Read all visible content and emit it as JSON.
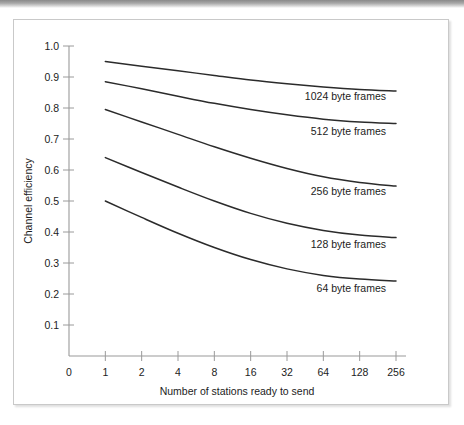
{
  "chart_data": {
    "type": "line",
    "title": "",
    "xlabel": "Number of stations ready to send",
    "ylabel": "Channel efficiency",
    "x_tick_labels": [
      "0",
      "1",
      "2",
      "4",
      "8",
      "16",
      "32",
      "64",
      "128",
      "256"
    ],
    "x_tick_values": [
      0,
      1,
      2,
      4,
      8,
      16,
      32,
      64,
      128,
      256
    ],
    "x_scale": "log2-categorical",
    "y_tick_labels": [
      "0.1",
      "0.2",
      "0.3",
      "0.4",
      "0.5",
      "0.6",
      "0.7",
      "0.8",
      "0.9",
      "1.0"
    ],
    "y_tick_values": [
      0.1,
      0.2,
      0.3,
      0.4,
      0.5,
      0.6,
      0.7,
      0.8,
      0.9,
      1.0
    ],
    "ylim": [
      0.0,
      1.0
    ],
    "grid": false,
    "legend_position": "inline-right-of-curves",
    "categories": [
      1,
      2,
      4,
      8,
      16,
      32,
      64,
      128,
      256
    ],
    "series": [
      {
        "name": "1024 byte frames",
        "label": "1024 byte frames",
        "color": "#2b2b2b",
        "values": [
          0.95,
          0.935,
          0.92,
          0.905,
          0.89,
          0.878,
          0.868,
          0.86,
          0.855
        ]
      },
      {
        "name": "512 byte frames",
        "label": "512 byte frames",
        "color": "#2b2b2b",
        "values": [
          0.885,
          0.862,
          0.838,
          0.815,
          0.795,
          0.778,
          0.764,
          0.755,
          0.75
        ]
      },
      {
        "name": "256 byte frames",
        "label": "256 byte frames",
        "color": "#2b2b2b",
        "values": [
          0.795,
          0.755,
          0.715,
          0.675,
          0.638,
          0.605,
          0.578,
          0.56,
          0.548
        ]
      },
      {
        "name": "128 byte frames",
        "label": "128 byte frames",
        "color": "#2b2b2b",
        "values": [
          0.64,
          0.592,
          0.545,
          0.5,
          0.46,
          0.428,
          0.405,
          0.39,
          0.382
        ]
      },
      {
        "name": "64 byte frames",
        "label": "64 byte frames",
        "color": "#2b2b2b",
        "values": [
          0.5,
          0.447,
          0.396,
          0.35,
          0.311,
          0.281,
          0.26,
          0.248,
          0.242
        ]
      }
    ],
    "series_label_anchor_x": [
      372,
      372,
      372,
      372,
      372
    ],
    "series_label_anchor_y": [
      80,
      115,
      175,
      228,
      272
    ]
  },
  "colors": {
    "curve": "#2b2b2b",
    "axis": "#9a9a9a",
    "text": "#1c1c1c",
    "card_border": "#c9c9c9",
    "page_background": "#ffffff"
  }
}
